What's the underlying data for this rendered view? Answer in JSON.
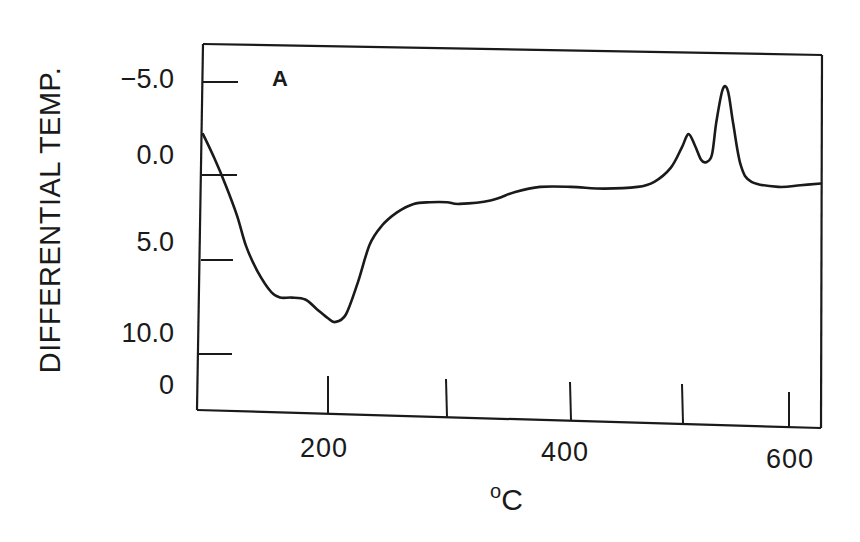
{
  "chart_data": {
    "type": "line",
    "title": "",
    "panel_label": "A",
    "xlabel": "°C",
    "ylabel": "DIFFERENTIAL TEMP.",
    "xlim": [
      90,
      628
    ],
    "ylim_display_top_to_bottom": [
      -5.0,
      10.0
    ],
    "y_inverted": true,
    "grid": false,
    "legend": null,
    "x_ticks": [
      200,
      300,
      400,
      500,
      600
    ],
    "x_tick_labels": [
      "200",
      "",
      "400",
      "",
      "600"
    ],
    "y_ticks": [
      -5.0,
      0.0,
      5.0,
      10.0
    ],
    "y_tick_labels": [
      "−5.0",
      "0.0",
      "5.0",
      "10.0",
      "0"
    ],
    "series": [
      {
        "name": "A",
        "x": [
          90,
          100,
          110,
          120,
          128,
          138,
          150,
          158,
          168,
          180,
          190,
          200,
          206,
          215,
          225,
          235,
          245,
          258,
          272,
          286,
          300,
          310,
          335,
          355,
          375,
          400,
          430,
          460,
          475,
          490,
          500,
          506,
          512,
          518,
          523,
          528,
          532,
          538,
          543,
          548,
          555,
          565,
          590,
          610,
          628
        ],
        "values": [
          -2.2,
          -0.9,
          0.6,
          2.4,
          4.2,
          5.6,
          6.7,
          7.0,
          7.0,
          7.1,
          7.6,
          8.1,
          8.3,
          7.9,
          6.2,
          4.1,
          3.0,
          2.2,
          1.7,
          1.6,
          1.6,
          1.7,
          1.5,
          1.0,
          0.7,
          0.7,
          0.8,
          0.7,
          0.4,
          -0.4,
          -1.5,
          -2.2,
          -1.6,
          -0.8,
          -0.7,
          -1.1,
          -2.8,
          -4.6,
          -4.5,
          -2.7,
          -0.5,
          0.4,
          0.7,
          0.6,
          0.5
        ]
      }
    ]
  },
  "labels": {
    "ylabel": "DIFFERENTIAL TEMP.",
    "panel": "A",
    "xunit_degree": "o",
    "xunit_letter": "C",
    "yticks": [
      "−5.0",
      "0.0",
      "5.0",
      "10.0",
      "0"
    ],
    "xticks": [
      "200",
      "400",
      "600"
    ]
  },
  "style": {
    "ink": "#1a1a1a",
    "background": "#ffffff"
  }
}
